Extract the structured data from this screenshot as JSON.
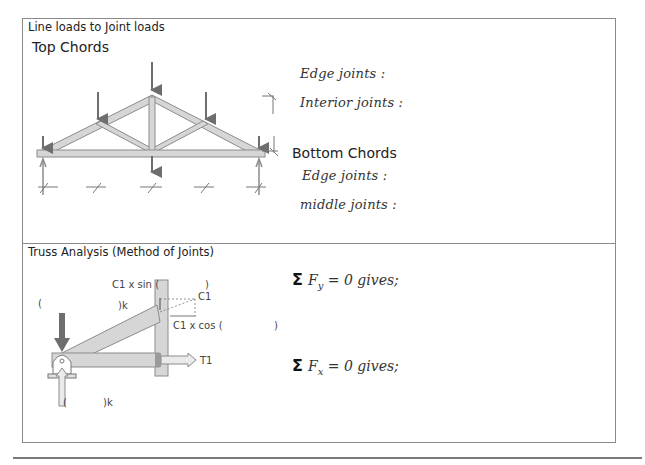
{
  "section1": {
    "title": "Line loads to Joint loads",
    "top_chords": {
      "heading": "Top Chords",
      "lines": [
        "Edge joints :",
        "Interior joints :"
      ]
    },
    "bottom_chords": {
      "heading": "Bottom Chords",
      "lines": [
        "Edge joints :",
        "middle joints :"
      ]
    },
    "figure": "truss-with-joint-loads"
  },
  "section2": {
    "title": "Truss Analysis (Method of Joints)",
    "figure_labels": {
      "c1_sin": "C1 x sin (",
      "c1_sin_close": ")",
      "c1": "C1",
      "c1_cos": "C1 x cos (",
      "c1_cos_close": ")",
      "left_paren": "(",
      "load_k": ")k",
      "reaction_open": "(",
      "reaction_k": ")k",
      "t1": "T1"
    },
    "equations": [
      {
        "symbol": "Σ",
        "var": "F",
        "sub": "y",
        "rest": " = 0 gives;"
      },
      {
        "symbol": "Σ",
        "var": "F",
        "sub": "x",
        "rest": " = 0 gives;"
      }
    ]
  },
  "colors": {
    "border": "#8a8a8a",
    "member_fill": "#d6d6d6",
    "member_stroke": "#8c8c8c",
    "arrow_dark": "#6e6e6e"
  }
}
